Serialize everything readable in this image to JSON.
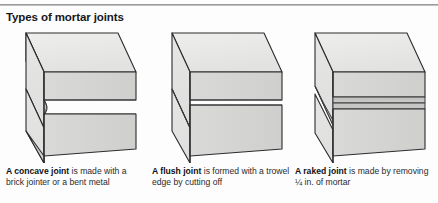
{
  "figure": {
    "title": "Types of mortar joints",
    "colors": {
      "brick_face_light": "#e4e4e2",
      "brick_face_top": "#ebebe9",
      "brick_face_side": "#d5d5d3",
      "outline": "#2c2c2e",
      "joint_line": "#3a3a3c",
      "rule": "#8d8d8d",
      "text": "#2a2a2c",
      "background": "#fdfdfd"
    },
    "panels": [
      {
        "id": "concave",
        "joint_type": "concave",
        "joint_profile": "curved-indent",
        "illustration_name": "concave-mortar-joint-brick-diagram",
        "caption_bold": "A concave joint",
        "caption_rest": " is made with a brick jointer or a bent metal"
      },
      {
        "id": "flush",
        "joint_type": "flush",
        "joint_profile": "flat-flush",
        "illustration_name": "flush-mortar-joint-brick-diagram",
        "caption_bold": "A flush joint",
        "caption_rest": " is formed with a trowel edge by cutting off"
      },
      {
        "id": "raked",
        "joint_type": "raked",
        "joint_profile": "recessed-step",
        "illustration_name": "raked-mortar-joint-brick-diagram",
        "caption_bold": "A raked joint",
        "caption_rest": " is made by removing ¼ in. of mortar"
      }
    ]
  }
}
